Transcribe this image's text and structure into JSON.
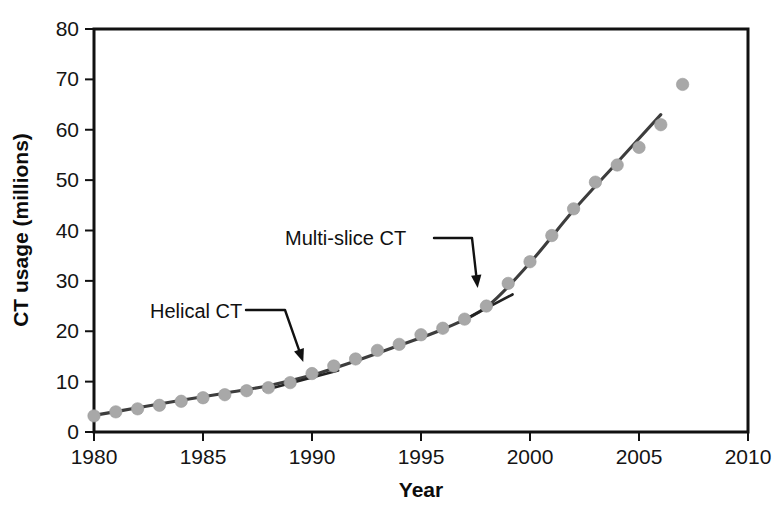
{
  "figure": {
    "title": "",
    "background_color": "#ffffff"
  },
  "axes": {
    "x_title": "Year",
    "y_title": "CT usage (millions)",
    "x_ticks": [
      "1980",
      "1985",
      "1990",
      "1995",
      "2000",
      "2005",
      "2010"
    ],
    "y_ticks": [
      "0",
      "10",
      "20",
      "30",
      "40",
      "50",
      "60",
      "70",
      "80"
    ]
  },
  "annotations": [
    {
      "label": "Helical CT",
      "target_year": 1989.6,
      "target_value": 11.5
    },
    {
      "label": "Multi-slice CT",
      "target_year": 1997.6,
      "target_value": 26.0
    }
  ],
  "colors": {
    "marker": "#a8a8a8",
    "trend": "#3d3d3d",
    "axis": "#111111",
    "text": "#111111"
  },
  "chart_data": {
    "type": "scatter",
    "title": "",
    "xlabel": "Year",
    "ylabel": "CT usage (millions)",
    "xlim": [
      1980,
      2010
    ],
    "ylim": [
      0,
      80
    ],
    "xticks": [
      1980,
      1985,
      1990,
      1995,
      2000,
      2005,
      2010
    ],
    "yticks": [
      0,
      10,
      20,
      30,
      40,
      50,
      60,
      70,
      80
    ],
    "grid": false,
    "legend": false,
    "x": [
      1980,
      1981,
      1982,
      1983,
      1984,
      1985,
      1986,
      1987,
      1988,
      1989,
      1990,
      1991,
      1992,
      1993,
      1994,
      1995,
      1996,
      1997,
      1998,
      1999,
      2000,
      2001,
      2002,
      2003,
      2004,
      2005,
      2006,
      2007
    ],
    "values": [
      3.2,
      4.0,
      4.6,
      5.3,
      6.1,
      6.8,
      7.4,
      8.2,
      8.8,
      9.8,
      11.6,
      13.1,
      14.5,
      16.2,
      17.4,
      19.3,
      20.6,
      22.4,
      25.0,
      29.5,
      33.8,
      39.0,
      44.3,
      49.6,
      53.0,
      56.5,
      61.0,
      69.0
    ],
    "series": [
      {
        "name": "CT usage (millions)",
        "values": [
          3.2,
          4.0,
          4.6,
          5.3,
          6.1,
          6.8,
          7.4,
          8.2,
          8.8,
          9.8,
          11.6,
          13.1,
          14.5,
          16.2,
          17.4,
          19.3,
          20.6,
          22.4,
          25.0,
          29.5,
          33.8,
          39.0,
          44.3,
          49.6,
          53.0,
          56.5,
          61.0,
          69.0
        ]
      }
    ],
    "trend_line": {
      "name": "smoothed fit",
      "x": [
        1980,
        1982,
        1984,
        1986,
        1988,
        1990,
        1992,
        1994,
        1996,
        1998,
        2000,
        2002,
        2004,
        2006
      ],
      "y": [
        3.3,
        4.8,
        6.3,
        7.7,
        9.2,
        11.3,
        14.1,
        17.2,
        20.4,
        24.8,
        33.6,
        44.0,
        53.5,
        63.0
      ]
    },
    "tangent_segments": [
      {
        "name": "helical-tangent",
        "x": [
          1987.8,
          1991.2
        ],
        "y": [
          8.3,
          12.2
        ]
      },
      {
        "name": "multislice-tangent",
        "x": [
          1997.0,
          1999.2
        ],
        "y": [
          22.3,
          27.3
        ]
      }
    ]
  }
}
